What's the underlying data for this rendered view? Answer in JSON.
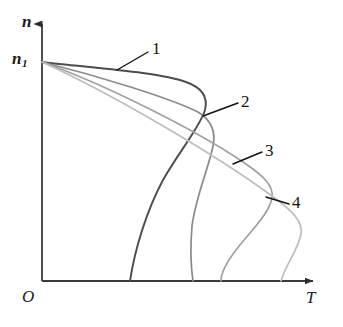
{
  "figure": {
    "title": "",
    "background_color": "#ffffff"
  },
  "axes": {
    "y_label": "n",
    "y_tick_label": "n",
    "y_tick_sub": "1",
    "origin_label": "O",
    "x_label": "T",
    "axis_color": "#3a3a3a",
    "x_axis_y": 281,
    "y_axis_x": 42,
    "x_axis_end": 322,
    "y_axis_top": 17
  },
  "curve_labels": [
    {
      "id": "1",
      "text": "1",
      "color": "#111111"
    },
    {
      "id": "2",
      "text": "2",
      "color": "#111111"
    },
    {
      "id": "3",
      "text": "3",
      "color": "#111111"
    },
    {
      "id": "4",
      "text": "4",
      "color": "#111111"
    }
  ],
  "chart_data": {
    "type": "line",
    "title": "",
    "xlabel": "T",
    "ylabel": "n",
    "grid": false,
    "legend": "inline-annotations",
    "axis_ranges": {
      "x": [
        0,
        1
      ],
      "y": [
        0,
        1
      ]
    },
    "common_start_point": {
      "x": 42,
      "y": 62,
      "label": "n1"
    },
    "series": [
      {
        "name": "1",
        "color": "#4d4d4d",
        "width": 1.9,
        "nose_point": {
          "x": 203,
          "y": 90
        },
        "baseline_x": 130,
        "path": "M42,62 C92,68 158,72 186,82 C203,88 208,98 205,110 C200,127 180,150 163,180 C147,210 135,248 130,281"
      },
      {
        "name": "2",
        "color": "#8a8a8a",
        "width": 1.7,
        "nose_point": {
          "x": 213,
          "y": 118
        },
        "baseline_x": 193,
        "path": "M42,62 C98,76 170,98 198,112 C211,120 216,132 213,146 C209,167 196,196 192,226 C190,250 191,268 193,281"
      },
      {
        "name": "3",
        "color": "#a0a0a0",
        "width": 1.7,
        "nose_point": {
          "x": 272,
          "y": 192
        },
        "baseline_x": 221,
        "path": "M42,62 C104,84 196,130 243,162 C264,176 274,186 272,198 C269,214 250,232 236,250 C226,263 221,273 221,281"
      },
      {
        "name": "4",
        "color": "#bdbdbd",
        "width": 1.7,
        "nose_point": {
          "x": 302,
          "y": 208
        },
        "baseline_x": 273,
        "path": "M42,62 C108,92 212,152 272,196 C294,212 303,222 301,234 C298,250 286,264 281,281"
      }
    ],
    "leader_lines": [
      {
        "for": "1",
        "from": [
          148,
          52
        ],
        "to": [
          117,
          70
        ]
      },
      {
        "for": "2",
        "from": [
          238,
          103
        ],
        "to": [
          203,
          116
        ]
      },
      {
        "for": "3",
        "from": [
          262,
          152
        ],
        "to": [
          233,
          164
        ]
      },
      {
        "for": "4",
        "from": [
          289,
          204
        ],
        "to": [
          266,
          197
        ]
      }
    ]
  }
}
